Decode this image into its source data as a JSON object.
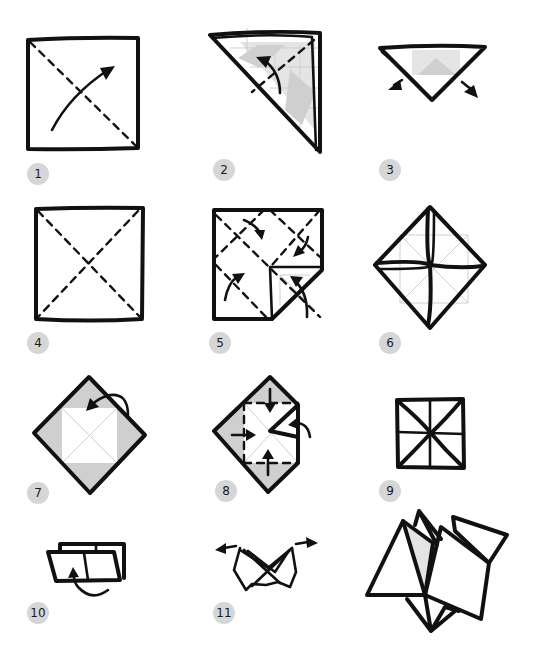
{
  "diagram": {
    "colors": {
      "ink": "#111111",
      "shade": "#cfcfcf",
      "badge": "#d6d6d6"
    },
    "steps": [
      {
        "number": "1",
        "description": "Fold square diagonally"
      },
      {
        "number": "2",
        "description": "Fold triangle in half"
      },
      {
        "number": "3",
        "description": "Unfold"
      },
      {
        "number": "4",
        "description": "Square with both diagonal creases"
      },
      {
        "number": "5",
        "description": "Fold corners to center"
      },
      {
        "number": "6",
        "description": "Corners folded to center"
      },
      {
        "number": "7",
        "description": "Flip over"
      },
      {
        "number": "8",
        "description": "Fold corners to center again"
      },
      {
        "number": "9",
        "description": "Folded square"
      },
      {
        "number": "10",
        "description": "Fold in half"
      },
      {
        "number": "11",
        "description": "Pull flaps apart"
      },
      {
        "number": "",
        "description": "Finished fortune teller"
      }
    ]
  }
}
